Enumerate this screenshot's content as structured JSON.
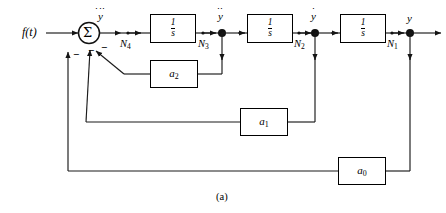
{
  "figure": {
    "caption": "(a)",
    "type": "control-system-block-diagram"
  },
  "signals": {
    "input_label": "f(t)",
    "output_label": "y",
    "derivative_3": "y",
    "derivative_2": "y",
    "derivative_1": "y"
  },
  "summing_junction": {
    "symbol": "Σ",
    "sign_input": "+",
    "sign_feedback_1": "−",
    "sign_feedback_2": "−",
    "sign_feedback_3": "−"
  },
  "nodes": [
    {
      "id": "N4",
      "label": "N",
      "subscript": "4"
    },
    {
      "id": "N3",
      "label": "N",
      "subscript": "3"
    },
    {
      "id": "N2",
      "label": "N",
      "subscript": "2"
    },
    {
      "id": "N1",
      "label": "N",
      "subscript": "1"
    }
  ],
  "integrators": [
    {
      "id": "integrator-1",
      "numerator": "1",
      "denominator": "s"
    },
    {
      "id": "integrator-2",
      "numerator": "1",
      "denominator": "s"
    },
    {
      "id": "integrator-3",
      "numerator": "1",
      "denominator": "s"
    }
  ],
  "gain_blocks": [
    {
      "id": "gain-a2",
      "label": "a",
      "subscript": "2"
    },
    {
      "id": "gain-a1",
      "label": "a",
      "subscript": "1"
    },
    {
      "id": "gain-a0",
      "label": "a",
      "subscript": "0"
    }
  ],
  "colors": {
    "line": "#1a1a1a",
    "block_border": "#000000",
    "background": "#ffffff",
    "text": "#000000"
  }
}
